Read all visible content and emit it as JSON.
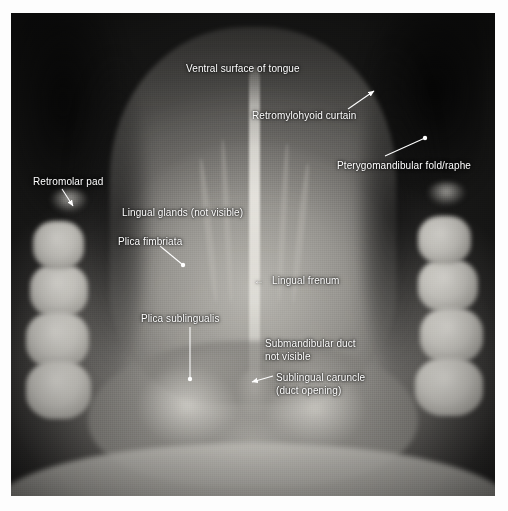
{
  "figure": {
    "kind": "clinical-photograph",
    "modality": "grayscale intraoral photograph",
    "border_color": "#ffffff",
    "label_color": "#ffffff",
    "plate": {
      "x": 11,
      "y": 13,
      "width": 484,
      "height": 483
    }
  },
  "labels": [
    {
      "id": "ventral-surface-of-tongue",
      "text": "Ventral surface of tongue",
      "x": 186,
      "y": 63,
      "align": "left",
      "leader": null
    },
    {
      "id": "retromylohyoid-curtain",
      "text": "Retromylohyoid curtain",
      "x": 252,
      "y": 110,
      "align": "left",
      "leader": {
        "type": "arrow",
        "from": [
          348,
          109
        ],
        "to": [
          374,
          91
        ]
      }
    },
    {
      "id": "pterygomandibular-fold-raphe",
      "text": "Pterygomandibular fold/raphe",
      "x": 337,
      "y": 160,
      "align": "left",
      "leader": {
        "type": "line-dot",
        "from": [
          385,
          156
        ],
        "to": [
          425,
          138
        ]
      }
    },
    {
      "id": "retromolar-pad",
      "text": "Retromolar pad",
      "x": 33,
      "y": 176,
      "align": "left",
      "leader": {
        "type": "arrow",
        "from": [
          62,
          189
        ],
        "to": [
          73,
          206
        ]
      }
    },
    {
      "id": "lingual-glands-not-visible",
      "text": "Lingual glands (not visible)",
      "x": 122,
      "y": 207,
      "align": "left",
      "leader": null
    },
    {
      "id": "plica-fimbriata",
      "text": "Plica fimbriata",
      "x": 118,
      "y": 236,
      "align": "left",
      "leader": {
        "type": "line-dot",
        "from": [
          160,
          246
        ],
        "to": [
          183,
          265
        ]
      }
    },
    {
      "id": "lingual-frenum",
      "text": "Lingual frenum",
      "x": 272,
      "y": 275,
      "align": "left",
      "arrow_glyph": "←",
      "arrow_glyph_x": 254,
      "leader": null
    },
    {
      "id": "plica-sublingualis",
      "text": "Plica sublingualis",
      "x": 141,
      "y": 313,
      "align": "left",
      "leader": {
        "type": "line-dot",
        "from": [
          190,
          327
        ],
        "to": [
          190,
          379
        ]
      }
    },
    {
      "id": "submandibular-duct-not-visible",
      "text": "Submandibular duct\nnot visible",
      "x": 265,
      "y": 338,
      "align": "left",
      "leader": null
    },
    {
      "id": "sublingual-caruncle-duct-opening",
      "text": "Sublingual caruncle\n(duct opening)",
      "x": 276,
      "y": 372,
      "align": "left",
      "leader": {
        "type": "arrow",
        "from": [
          273,
          376
        ],
        "to": [
          252,
          382
        ]
      }
    }
  ],
  "structures": {
    "teeth_left": [
      {
        "x": 4.0,
        "y": 52.0,
        "w": 12.0,
        "h": 11.0
      },
      {
        "x": 3.2,
        "y": 62.0,
        "w": 13.0,
        "h": 11.5
      },
      {
        "x": 3.0,
        "y": 72.0,
        "w": 13.5,
        "h": 12.0
      },
      {
        "x": 4.5,
        "y": 43.0,
        "w": 10.5,
        "h": 10.0
      }
    ],
    "teeth_right": [
      {
        "x": 84.0,
        "y": 51.0,
        "w": 12.5,
        "h": 11.0
      },
      {
        "x": 84.5,
        "y": 61.0,
        "w": 13.0,
        "h": 11.5
      },
      {
        "x": 83.5,
        "y": 71.5,
        "w": 14.0,
        "h": 12.0
      },
      {
        "x": 84.0,
        "y": 42.0,
        "w": 11.0,
        "h": 10.0
      }
    ],
    "pads": [
      {
        "x": 8.0,
        "y": 36.5,
        "w": 8.0,
        "h": 5.0
      },
      {
        "x": 86.0,
        "y": 35.0,
        "w": 8.0,
        "h": 5.0
      }
    ],
    "plicae": [
      {
        "x": 30.0,
        "y": 70.0,
        "w": 18.0,
        "h": 9.0,
        "rot": -14
      },
      {
        "x": 53.0,
        "y": 70.0,
        "w": 18.0,
        "h": 9.0,
        "rot": 14
      }
    ],
    "fimbriae": [
      {
        "x": 40.0,
        "y": 30.0,
        "w": 1.4,
        "h": 30.0,
        "rot": -6
      },
      {
        "x": 44.0,
        "y": 26.0,
        "w": 1.2,
        "h": 34.0,
        "rot": -3
      },
      {
        "x": 55.5,
        "y": 27.0,
        "w": 1.2,
        "h": 33.0,
        "rot": 3
      },
      {
        "x": 59.0,
        "y": 31.0,
        "w": 1.4,
        "h": 29.0,
        "rot": 6
      }
    ]
  }
}
